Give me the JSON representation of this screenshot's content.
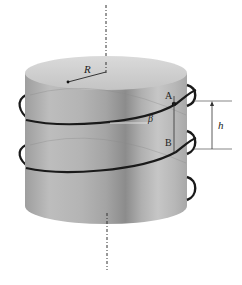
{
  "diagram": {
    "type": "helix-on-cylinder",
    "labels": {
      "radius": "R",
      "point_a": "A",
      "point_b": "B",
      "angle": "β",
      "pitch": "h"
    },
    "colors": {
      "background": "#ffffff",
      "cylinder_light": "#c8c8c8",
      "cylinder_dark": "#8a8a8a",
      "cylinder_top": "#cfcfcf",
      "helix": "#1a1a1a",
      "axis": "#333333",
      "dimension_line": "#444444"
    }
  }
}
